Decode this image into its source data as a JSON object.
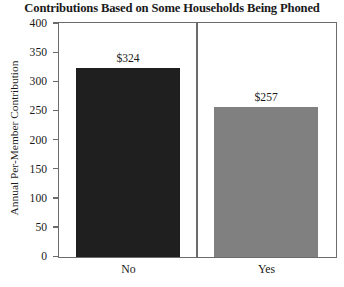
{
  "chart_data": {
    "type": "bar",
    "title": "Contributions Based on Some Households Being Phoned",
    "xlabel": "",
    "ylabel": "Annual Per-Member Contribution",
    "categories": [
      "No",
      "Yes"
    ],
    "values": [
      324,
      257
    ],
    "data_labels": [
      "$324",
      "$257"
    ],
    "ylim": [
      0,
      400
    ],
    "yticks": [
      0,
      50,
      100,
      150,
      200,
      250,
      300,
      350,
      400
    ],
    "ytick_labels": [
      "0",
      "50",
      "100",
      "150",
      "200",
      "250",
      "300",
      "350",
      "400"
    ],
    "grid": false,
    "legend": "none",
    "panel_layout": "two-panel-trellis",
    "series": [
      {
        "name": "Annual Per-Member Contribution",
        "points": [
          {
            "category": "No",
            "value": 324,
            "label": "$324",
            "color": "#1f1f1f"
          },
          {
            "category": "Yes",
            "value": 257,
            "label": "$257",
            "color": "#808080"
          }
        ]
      }
    ],
    "colors": {
      "bar_no": "#1f1f1f",
      "bar_yes": "#808080",
      "axis": "#6b6b6b",
      "text": "#1a1a1a",
      "background": "#ffffff"
    }
  }
}
